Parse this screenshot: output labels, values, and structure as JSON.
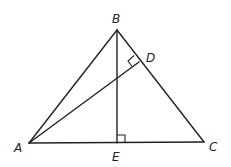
{
  "diagram": {
    "type": "geometry-triangle",
    "points": {
      "A": {
        "label": "A",
        "x": 29,
        "y": 143
      },
      "B": {
        "label": "B",
        "x": 117,
        "y": 30
      },
      "C": {
        "label": "C",
        "x": 204,
        "y": 142
      },
      "D": {
        "label": "D",
        "x": 139,
        "y": 62
      },
      "E": {
        "label": "E",
        "x": 117,
        "y": 143
      }
    },
    "segments": [
      "AB",
      "BC",
      "AC",
      "BE",
      "AD"
    ],
    "right_angles": [
      "BEC",
      "ADB"
    ],
    "colors": {
      "stroke": "#222222",
      "background": "#ffffff"
    }
  }
}
